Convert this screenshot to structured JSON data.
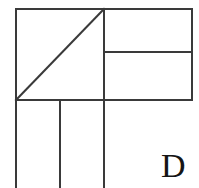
{
  "figure": {
    "kind": "line-drawing",
    "canvas": {
      "width": 199,
      "height": 188,
      "background": "#ffffff"
    },
    "stroke_color": "#3a3a3a",
    "stroke_width": 2,
    "label": {
      "text": "D",
      "color": "#151515",
      "x": 161,
      "y": 149,
      "font_size": 34
    },
    "segments": [
      {
        "name": "outer-top-edge",
        "x1": 16,
        "y1": 9,
        "x2": 192,
        "y2": 9
      },
      {
        "name": "outer-right-edge",
        "x1": 192,
        "y1": 9,
        "x2": 192,
        "y2": 100
      },
      {
        "name": "middle-horizontal",
        "x1": 16,
        "y1": 100,
        "x2": 192,
        "y2": 100
      },
      {
        "name": "left-vertical",
        "x1": 16,
        "y1": 9,
        "x2": 16,
        "y2": 188
      },
      {
        "name": "center-vertical",
        "x1": 104,
        "y1": 9,
        "x2": 104,
        "y2": 188
      },
      {
        "name": "inner-left-vertical",
        "x1": 60,
        "y1": 100,
        "x2": 60,
        "y2": 188
      },
      {
        "name": "inner-right-horizontal",
        "x1": 104,
        "y1": 52,
        "x2": 192,
        "y2": 52
      },
      {
        "name": "square-diagonal",
        "x1": 16,
        "y1": 100,
        "x2": 104,
        "y2": 9
      }
    ]
  }
}
